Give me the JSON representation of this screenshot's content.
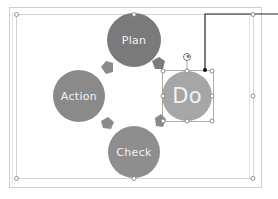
{
  "diagram": {
    "type": "cycle",
    "nodes": [
      {
        "id": "plan",
        "label": "Plan",
        "color": "#7a7a7a"
      },
      {
        "id": "do",
        "label": "Do",
        "color": "#a6a6a6",
        "selected": true
      },
      {
        "id": "check",
        "label": "Check",
        "color": "#8e8e8e"
      },
      {
        "id": "action",
        "label": "Action",
        "color": "#8a8a8a"
      }
    ],
    "arrow_color": "#8a8a8a",
    "connector_color": "#222222",
    "frame_color": "#c8c8c8",
    "handle_color": "#ffffff"
  }
}
